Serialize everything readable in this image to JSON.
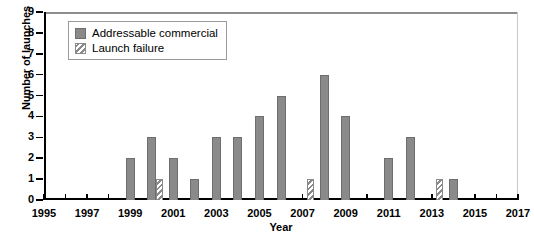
{
  "chart_data": {
    "type": "bar",
    "title": "",
    "xlabel": "Year",
    "ylabel": "Number of launches",
    "xlim": [
      1995,
      2017
    ],
    "ylim": [
      0,
      9
    ],
    "ytick_step": 1,
    "xtick_step": 1,
    "xtick_label_step": 2,
    "grid": false,
    "legend_position": "top-left",
    "yticks": [
      "0",
      "1",
      "2",
      "3",
      "4",
      "5",
      "6",
      "7",
      "8",
      "9"
    ],
    "xticks_labeled": [
      "1995",
      "1997",
      "1999",
      "2001",
      "2003",
      "2005",
      "2007",
      "2009",
      "2011",
      "2013",
      "2015",
      "2017"
    ],
    "categories": [
      1995,
      1996,
      1997,
      1998,
      1999,
      2000,
      2001,
      2002,
      2003,
      2004,
      2005,
      2006,
      2007,
      2008,
      2009,
      2010,
      2011,
      2012,
      2013,
      2014,
      2015,
      2016,
      2017
    ],
    "series": [
      {
        "name": "Addressable commercial",
        "color": "#8a8a8a",
        "pattern": "solid",
        "values": [
          0,
          0,
          0,
          0,
          2,
          3,
          2,
          1,
          3,
          3,
          4,
          5,
          0,
          6,
          4,
          0,
          2,
          3,
          0,
          1,
          0,
          0,
          0
        ]
      },
      {
        "name": "Launch failure",
        "color": "#8a8a8a",
        "pattern": "diagonal-hatch",
        "values": [
          0,
          0,
          0,
          0,
          0,
          1,
          0,
          0,
          0,
          0,
          0,
          0,
          1,
          0,
          0,
          0,
          0,
          0,
          1,
          0,
          0,
          0,
          0
        ]
      }
    ]
  },
  "legend": {
    "items": [
      {
        "label": "Addressable commercial",
        "pattern": "solid"
      },
      {
        "label": "Launch failure",
        "pattern": "diagonal-hatch"
      }
    ]
  },
  "caption": ""
}
